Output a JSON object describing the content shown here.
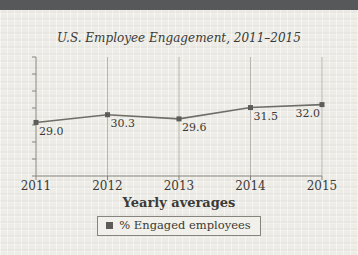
{
  "page": {
    "background_color": "#edece6",
    "header_bar_color": "#57585a"
  },
  "chart_data": {
    "type": "line",
    "title": "U.S. Employee Engagement, 2011–2015",
    "categories": [
      "2011",
      "2012",
      "2013",
      "2014",
      "2015"
    ],
    "series": [
      {
        "name": "% Engaged employees",
        "values": [
          29.0,
          30.3,
          29.6,
          31.5,
          32.0
        ]
      }
    ],
    "xlabel": "Yearly averages",
    "ylabel": "",
    "ylim": [
      20,
      40
    ],
    "y_ticks": {
      "count": 8,
      "labeled": false
    },
    "grid": "vertical-only",
    "legend_position": "bottom-center",
    "marker": "square",
    "colors": {
      "line": "#6f6e69",
      "marker": "#5d5c58",
      "axis": "#85837d",
      "gridline": "#b9b7af",
      "text": "#3b3a36"
    }
  },
  "legend": {
    "label": "% Engaged employees",
    "swatch_color": "#5d5c58"
  }
}
